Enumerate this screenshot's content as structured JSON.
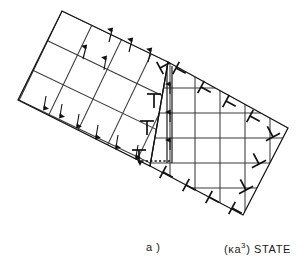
{
  "figure": {
    "name": "grain-boundary-dislocation-diagram",
    "panel_label": "a )",
    "state_label_prefix": "(",
    "state_label_kappa": "κ",
    "state_label_a": "a",
    "state_label_exponent": "3",
    "state_label_suffix": ") STATE",
    "state_label_full": "(κa³) STATE",
    "colors": {
      "ink": "#1a1a1a",
      "grid_line": "#3c3c3c",
      "boundary_line": "#111111",
      "background": "#ffffff"
    }
  },
  "lattices": {
    "rotated_grain": {
      "name": "rotated-lattice",
      "rotation_deg": -21,
      "columns": 5,
      "rows": 4,
      "origin_x": 62,
      "origin_y": 11,
      "cell": 33
    },
    "straight_grain": {
      "name": "straight-lattice",
      "columns": 5,
      "rows": 5,
      "origin_x": 168,
      "origin_y": 63,
      "cell": 25
    }
  },
  "dislocations": {
    "upright_T_symbols": [
      {
        "name": "dislocation-T-1",
        "x": 154,
        "y": 99,
        "rot": 0
      },
      {
        "name": "dislocation-T-2",
        "x": 147,
        "y": 124,
        "rot": 0
      },
      {
        "name": "dislocation-T-3",
        "x": 139,
        "y": 152,
        "rot": 0
      }
    ],
    "rotated_T_symbols": [
      {
        "name": "dislocation-rot-T-top",
        "x": 160,
        "y": 70,
        "rot": -21
      },
      {
        "name": "dislocation-rot-T-upper",
        "x": 175,
        "y": 69,
        "rot": -21
      },
      {
        "name": "dislocation-rot-T-a",
        "x": 200,
        "y": 88,
        "rot": -21
      },
      {
        "name": "dislocation-rot-T-b",
        "x": 224,
        "y": 104,
        "rot": -21
      },
      {
        "name": "dislocation-rot-T-c",
        "x": 248,
        "y": 119,
        "rot": -21
      },
      {
        "name": "dislocation-rot-T-lowerleft",
        "x": 165,
        "y": 172,
        "rot": 18
      },
      {
        "name": "dislocation-rot-T-lower-a",
        "x": 188,
        "y": 186,
        "rot": 18
      },
      {
        "name": "dislocation-rot-T-lower-b",
        "x": 212,
        "y": 198,
        "rot": 18
      },
      {
        "name": "dislocation-rot-T-lower-c",
        "x": 235,
        "y": 210,
        "rot": 18
      }
    ],
    "inverted_T_symbols": [
      {
        "name": "dislocation-perp-1",
        "x": 272,
        "y": 133,
        "rot": -21
      },
      {
        "name": "dislocation-perp-2",
        "x": 258,
        "y": 160,
        "rot": -21
      },
      {
        "name": "dislocation-perp-3",
        "x": 245,
        "y": 186,
        "rot": -21
      }
    ]
  },
  "burgers": {
    "name": "burgers-circuit",
    "vertical_track_x1": 167,
    "vertical_track_x2": 172,
    "top_y": 68,
    "bottom_y": 163,
    "vector_label": "b",
    "dotted_arrow": {
      "name": "burgers-vector-arrow",
      "from_x": 170,
      "from_y": 161,
      "to_x": 137,
      "to_y": 161
    }
  }
}
